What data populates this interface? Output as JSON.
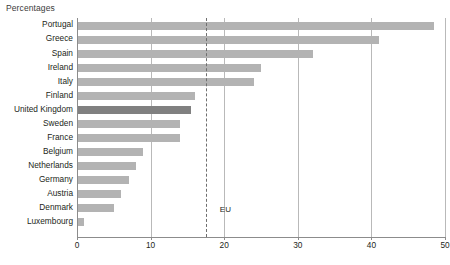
{
  "chart_data": {
    "type": "bar",
    "orientation": "horizontal",
    "title": "Percentages",
    "xlabel": "",
    "ylabel": "",
    "xlim": [
      0,
      50
    ],
    "xticks": [
      0,
      10,
      20,
      30,
      40,
      50
    ],
    "grid": true,
    "legend": false,
    "categories": [
      "Portugal",
      "Greece",
      "Spain",
      "Ireland",
      "Italy",
      "Finland",
      "United Kingdom",
      "Sweden",
      "France",
      "Belgium",
      "Netherlands",
      "Germany",
      "Austria",
      "Denmark",
      "Luxembourg"
    ],
    "values": [
      48.5,
      41,
      32,
      25,
      24,
      16,
      15.5,
      14,
      14,
      9,
      8,
      7,
      6,
      5,
      1
    ],
    "highlight_category": "United Kingdom",
    "annotations": [
      {
        "label": "EU",
        "value": 17.5,
        "style": "dashed-vertical-line"
      }
    ],
    "colors": {
      "bar": "#b3b3b3",
      "bar_highlight": "#808080",
      "gridline": "#b9b9b9",
      "axis": "#8c8c8c",
      "eu_line": "#6e6e6e",
      "text": "#231f20"
    }
  }
}
